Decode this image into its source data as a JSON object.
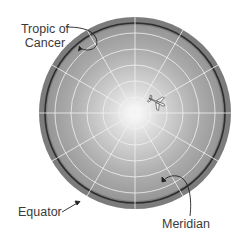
{
  "diagram": {
    "labels": {
      "tropic_line1": "Tropic of",
      "tropic_line2": "Cancer",
      "equator": "Equator",
      "meridian": "Meridian"
    },
    "icons": {
      "airplane": "airplane-icon"
    },
    "colors": {
      "outer_ring": "#7a7a7a",
      "equator_line": "#2e2e2e",
      "grid_lines": "#f2f2f2",
      "center_glow": "#ffffff",
      "globe_edge": "#8c8c8c",
      "label_text": "#3a3a3a"
    }
  }
}
